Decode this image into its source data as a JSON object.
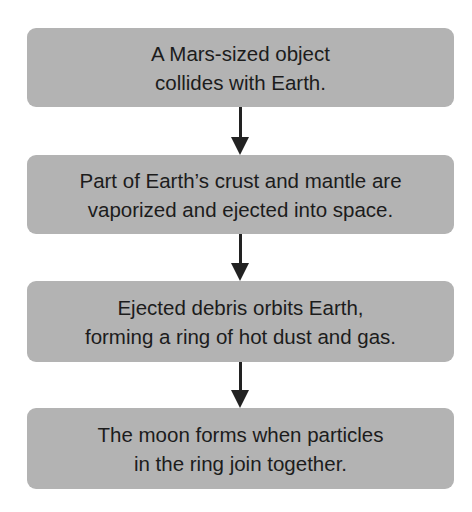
{
  "flowchart": {
    "steps": [
      {
        "lines": [
          "A Mars-sized object",
          "collides with Earth."
        ]
      },
      {
        "lines": [
          "Part of Earth’s crust and mantle are",
          "vaporized and ejected into space."
        ]
      },
      {
        "lines": [
          "Ejected debris orbits Earth,",
          "forming a ring of hot dust and gas."
        ]
      },
      {
        "lines": [
          "The moon forms when particles",
          "in the ring join together."
        ]
      }
    ],
    "colors": {
      "box_fill": "#b3b3b3",
      "arrow": "#222222",
      "text": "#1c1c1c"
    }
  }
}
